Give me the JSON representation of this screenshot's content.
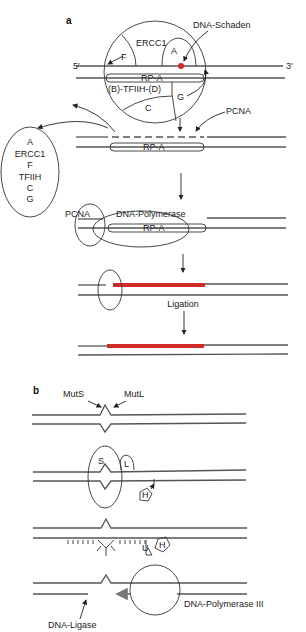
{
  "panel_a": {
    "label": "a",
    "complex": {
      "proteins": [
        "ERCC1",
        "F",
        "A",
        "G",
        "C"
      ],
      "rpa": "RP-A",
      "tfiih": "(B)-TFIIH-(D)",
      "damage_label": "DNA-Schaden",
      "five_prime": "5′",
      "three_prime": "3′"
    },
    "released": {
      "items": [
        "A",
        "ERCC1",
        "F",
        "TFIIH",
        "C",
        "G"
      ]
    },
    "step2": {
      "rpa": "RP-A",
      "pcna": "PCNA"
    },
    "step3": {
      "pcna": "PCNA",
      "polymerase": "DNA-Polymerase",
      "rpa": "RP-A"
    },
    "step4": {
      "ligation": "Ligation"
    },
    "colors": {
      "repair_patch": "#d12a2a",
      "damage": "#d12a2a",
      "strand": "#555555"
    }
  },
  "panel_b": {
    "label": "b",
    "step1": {
      "muts": "MutS",
      "mutl": "MutL"
    },
    "step2": {
      "s": "S",
      "l": "L",
      "h": "H"
    },
    "step3": {
      "u": "U",
      "h": "H"
    },
    "step4": {
      "polymerase": "DNA-Polymerase III",
      "ligase": "DNA-Ligase"
    }
  }
}
